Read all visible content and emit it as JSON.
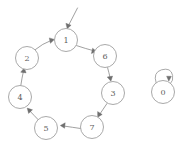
{
  "diagram": {
    "type": "directed-graph",
    "background_color": "#ffffff",
    "node_stroke_color": "#9a9a9a",
    "edge_color": "#8f8f8f",
    "label_color": "#5d5d5d",
    "nodes": [
      {
        "id": "1",
        "label": "1",
        "cx": 66,
        "cy": 40,
        "r": 11.5
      },
      {
        "id": "6",
        "label": "6",
        "cx": 105,
        "cy": 56,
        "r": 11.5
      },
      {
        "id": "3",
        "label": "3",
        "cx": 113,
        "cy": 93,
        "r": 11.5
      },
      {
        "id": "7",
        "label": "7",
        "cx": 92,
        "cy": 127,
        "r": 11.5
      },
      {
        "id": "5",
        "label": "5",
        "cx": 46,
        "cy": 128,
        "r": 11.5
      },
      {
        "id": "4",
        "label": "4",
        "cx": 20,
        "cy": 97,
        "r": 11.5
      },
      {
        "id": "2",
        "label": "2",
        "cx": 27,
        "cy": 58,
        "r": 11.5
      },
      {
        "id": "0",
        "label": "0",
        "cx": 163,
        "cy": 92,
        "r": 11.5
      }
    ],
    "edges": [
      {
        "from": "start",
        "to": "1",
        "kind": "entry"
      },
      {
        "from": "1",
        "to": "6",
        "kind": "arc"
      },
      {
        "from": "6",
        "to": "3",
        "kind": "arc"
      },
      {
        "from": "3",
        "to": "7",
        "kind": "arc"
      },
      {
        "from": "7",
        "to": "5",
        "kind": "arc"
      },
      {
        "from": "5",
        "to": "4",
        "kind": "arc"
      },
      {
        "from": "4",
        "to": "2",
        "kind": "arc"
      },
      {
        "from": "2",
        "to": "1",
        "kind": "arc"
      },
      {
        "from": "0",
        "to": "0",
        "kind": "self-loop"
      }
    ]
  }
}
